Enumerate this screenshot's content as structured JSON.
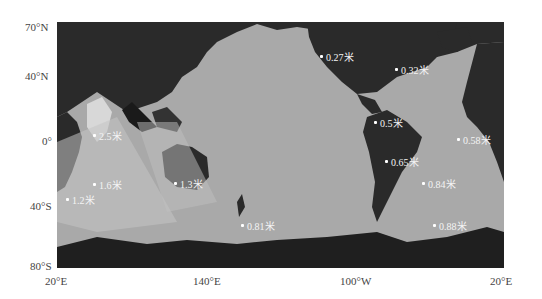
{
  "map": {
    "projection": "world, centered on Pacific",
    "colors": {
      "land": "#2a2a2a",
      "ocean": "#a9a9a9",
      "labels": "#f4f4f4"
    },
    "y_axis": [
      "70°N",
      "40°N",
      "0°",
      "40°S",
      "80°S"
    ],
    "x_axis": [
      "20°E",
      "140°E",
      "100°W",
      "20°E"
    ],
    "markers": [
      {
        "label": "0.27米",
        "x": 263,
        "y": 27
      },
      {
        "label": "0.32米",
        "x": 338,
        "y": 40
      },
      {
        "label": "0.5米",
        "x": 317,
        "y": 93
      },
      {
        "label": "0.58米",
        "x": 400,
        "y": 110
      },
      {
        "label": "0.65米",
        "x": 328,
        "y": 132
      },
      {
        "label": "0.84米",
        "x": 365,
        "y": 154
      },
      {
        "label": "0.88米",
        "x": 376,
        "y": 196
      },
      {
        "label": "0.81米",
        "x": 184,
        "y": 196
      },
      {
        "label": "1.3米",
        "x": 117,
        "y": 154
      },
      {
        "label": "1.6米",
        "x": 36,
        "y": 155
      },
      {
        "label": "1.2米",
        "x": 9,
        "y": 170
      },
      {
        "label": "2.5米",
        "x": 36,
        "y": 106
      }
    ]
  }
}
